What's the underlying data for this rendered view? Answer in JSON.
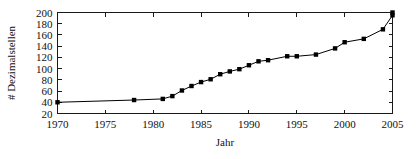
{
  "chart_data": {
    "type": "line",
    "title": "",
    "xlabel": "Jahr",
    "ylabel": "# Dezimalstellen",
    "xlim": [
      1970,
      2005
    ],
    "ylim": [
      20,
      200
    ],
    "xticks": [
      1970,
      1975,
      1980,
      1985,
      1990,
      1995,
      2000,
      2005
    ],
    "yticks": [
      20,
      40,
      60,
      80,
      100,
      120,
      140,
      160,
      180,
      200
    ],
    "grid": false,
    "legend": null,
    "marker": "square",
    "line_color": "#000000",
    "series": [
      {
        "name": "Dezimalstellen",
        "x": [
          1970,
          1978,
          1981,
          1982,
          1983,
          1984,
          1985,
          1986,
          1987,
          1988,
          1989,
          1990,
          1991,
          1992,
          1994,
          1995,
          1997,
          1999,
          2000,
          2002,
          2004,
          2005,
          2005
        ],
        "values": [
          40,
          44,
          46,
          51,
          61,
          69,
          76,
          81,
          90,
          95,
          99,
          106,
          113,
          115,
          122,
          122,
          125,
          136,
          147,
          153,
          170,
          195,
          200
        ]
      }
    ]
  }
}
